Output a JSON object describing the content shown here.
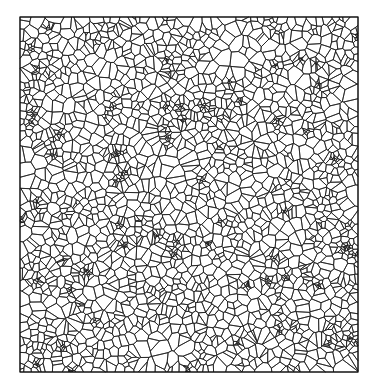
{
  "diagram": {
    "type": "voronoi-tessellation",
    "canvas": {
      "width": 378,
      "height": 392,
      "background": "#ffffff"
    },
    "frame": {
      "x": 20,
      "y": 17,
      "width": 338,
      "height": 355,
      "stroke": "#111111"
    },
    "cells": {
      "seed": 1337,
      "count": 1900,
      "cluster_count": 60,
      "cluster_points": 9,
      "cluster_radius": 5,
      "edge_color": "#1a1a1a",
      "edge_width": 0.75,
      "fill": "#ffffff"
    }
  }
}
